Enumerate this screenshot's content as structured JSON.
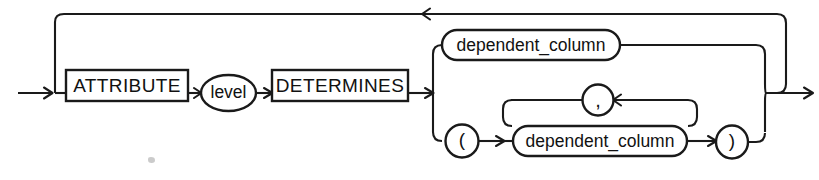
{
  "diagram": {
    "kind": "railroad-syntax-diagram",
    "stroke_color": "#1a1a1a",
    "background_color": "#ffffff",
    "nodes": {
      "attribute_keyword": "ATTRIBUTE",
      "level_nonterminal": "level",
      "determines_keyword": "DETERMINES",
      "dependent_column_single": "dependent_column",
      "dependent_column_list": "dependent_column",
      "comma_separator": ",",
      "open_paren": "(",
      "close_paren": ")"
    },
    "icons": {
      "entry_arrow": "arrow-right-icon",
      "exit_arrow": "arrow-right-icon",
      "loop_back_arrow": "arrow-left-icon",
      "comma_loop_arrow": "arrow-left-icon"
    },
    "paths": {
      "outer_repeat_loop": "loop-back-to-attribute",
      "branch_top": "single dependent_column",
      "branch_bottom": "parenthesized dependent_column list"
    }
  }
}
